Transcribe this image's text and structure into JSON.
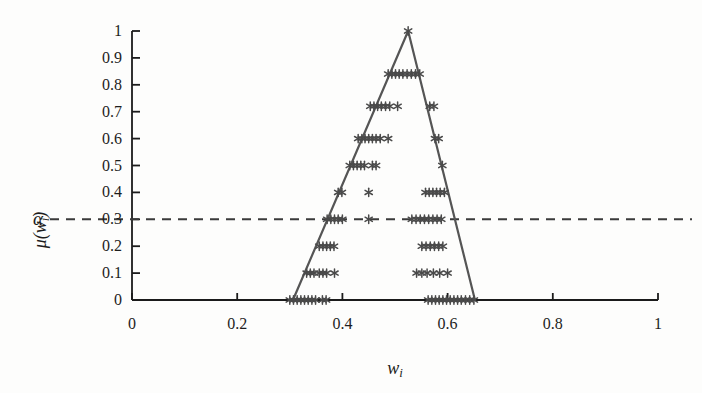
{
  "figure": {
    "background_color": "#fdfdfc",
    "axis_color": "#1b1b1b",
    "marker_color": "#4a4a4a",
    "triangle_color": "#555555",
    "dashed_color": "#3a3a3a"
  },
  "axes": {
    "x_label": "w",
    "x_label_sub": "i",
    "y_label": "μ(w",
    "y_label_sub": "i",
    "y_label_close": ")",
    "alpha_label": "α",
    "x_ticks": [
      "0",
      "0.2",
      "0.4",
      "0.6",
      "0.8",
      "1"
    ],
    "x_tick_values": [
      0,
      0.2,
      0.4,
      0.6,
      0.8,
      1
    ],
    "y_ticks": [
      "0",
      "0.1",
      "0.2",
      "0.3",
      "0.4",
      "0.5",
      "0.6",
      "0.7",
      "0.8",
      "0.9",
      "1"
    ],
    "y_tick_values": [
      0,
      0.1,
      0.2,
      0.3,
      0.4,
      0.5,
      0.6,
      0.7,
      0.8,
      0.9,
      1
    ]
  },
  "chart_data": {
    "type": "scatter",
    "title": "",
    "xlabel": "w_i",
    "ylabel": "μ(w_i)",
    "xlim": [
      0,
      1
    ],
    "ylim": [
      0,
      1
    ],
    "grid": false,
    "legend": null,
    "annotations": [
      {
        "name": "alpha-cut-line",
        "type": "horizontal-dashed-line",
        "y": 0.3,
        "label": "α"
      }
    ],
    "triangular_membership_function": {
      "name": "triangular-fuzzy-number",
      "left": 0.306,
      "peak": 0.525,
      "right": 0.652,
      "peak_value": 1
    },
    "points": [
      {
        "x": 0.525,
        "y": 1.0
      },
      {
        "x": 0.487,
        "y": 0.84
      },
      {
        "x": 0.494,
        "y": 0.84
      },
      {
        "x": 0.501,
        "y": 0.84
      },
      {
        "x": 0.508,
        "y": 0.84
      },
      {
        "x": 0.515,
        "y": 0.84
      },
      {
        "x": 0.523,
        "y": 0.84
      },
      {
        "x": 0.531,
        "y": 0.84
      },
      {
        "x": 0.539,
        "y": 0.84
      },
      {
        "x": 0.547,
        "y": 0.84
      },
      {
        "x": 0.453,
        "y": 0.72
      },
      {
        "x": 0.46,
        "y": 0.72
      },
      {
        "x": 0.467,
        "y": 0.72
      },
      {
        "x": 0.474,
        "y": 0.72
      },
      {
        "x": 0.482,
        "y": 0.72
      },
      {
        "x": 0.49,
        "y": 0.72
      },
      {
        "x": 0.505,
        "y": 0.72
      },
      {
        "x": 0.566,
        "y": 0.72
      },
      {
        "x": 0.574,
        "y": 0.72
      },
      {
        "x": 0.43,
        "y": 0.6
      },
      {
        "x": 0.437,
        "y": 0.6
      },
      {
        "x": 0.443,
        "y": 0.6
      },
      {
        "x": 0.45,
        "y": 0.6
      },
      {
        "x": 0.457,
        "y": 0.6
      },
      {
        "x": 0.464,
        "y": 0.6
      },
      {
        "x": 0.472,
        "y": 0.6
      },
      {
        "x": 0.487,
        "y": 0.6
      },
      {
        "x": 0.576,
        "y": 0.6
      },
      {
        "x": 0.583,
        "y": 0.6
      },
      {
        "x": 0.414,
        "y": 0.5
      },
      {
        "x": 0.421,
        "y": 0.5
      },
      {
        "x": 0.428,
        "y": 0.5
      },
      {
        "x": 0.435,
        "y": 0.5
      },
      {
        "x": 0.442,
        "y": 0.5
      },
      {
        "x": 0.457,
        "y": 0.5
      },
      {
        "x": 0.464,
        "y": 0.5
      },
      {
        "x": 0.59,
        "y": 0.5
      },
      {
        "x": 0.392,
        "y": 0.4
      },
      {
        "x": 0.399,
        "y": 0.4
      },
      {
        "x": 0.45,
        "y": 0.4
      },
      {
        "x": 0.558,
        "y": 0.4
      },
      {
        "x": 0.565,
        "y": 0.4
      },
      {
        "x": 0.572,
        "y": 0.4
      },
      {
        "x": 0.579,
        "y": 0.4
      },
      {
        "x": 0.586,
        "y": 0.4
      },
      {
        "x": 0.594,
        "y": 0.4
      },
      {
        "x": 0.371,
        "y": 0.3
      },
      {
        "x": 0.378,
        "y": 0.3
      },
      {
        "x": 0.385,
        "y": 0.3
      },
      {
        "x": 0.392,
        "y": 0.3
      },
      {
        "x": 0.4,
        "y": 0.3
      },
      {
        "x": 0.45,
        "y": 0.3
      },
      {
        "x": 0.532,
        "y": 0.3
      },
      {
        "x": 0.54,
        "y": 0.3
      },
      {
        "x": 0.548,
        "y": 0.3
      },
      {
        "x": 0.556,
        "y": 0.3
      },
      {
        "x": 0.564,
        "y": 0.3
      },
      {
        "x": 0.572,
        "y": 0.3
      },
      {
        "x": 0.58,
        "y": 0.3
      },
      {
        "x": 0.588,
        "y": 0.3
      },
      {
        "x": 0.356,
        "y": 0.2
      },
      {
        "x": 0.363,
        "y": 0.2
      },
      {
        "x": 0.37,
        "y": 0.2
      },
      {
        "x": 0.377,
        "y": 0.2
      },
      {
        "x": 0.384,
        "y": 0.2
      },
      {
        "x": 0.551,
        "y": 0.2
      },
      {
        "x": 0.559,
        "y": 0.2
      },
      {
        "x": 0.567,
        "y": 0.2
      },
      {
        "x": 0.575,
        "y": 0.2
      },
      {
        "x": 0.583,
        "y": 0.2
      },
      {
        "x": 0.591,
        "y": 0.2
      },
      {
        "x": 0.332,
        "y": 0.1
      },
      {
        "x": 0.339,
        "y": 0.1
      },
      {
        "x": 0.346,
        "y": 0.1
      },
      {
        "x": 0.356,
        "y": 0.1
      },
      {
        "x": 0.363,
        "y": 0.1
      },
      {
        "x": 0.37,
        "y": 0.1
      },
      {
        "x": 0.385,
        "y": 0.1
      },
      {
        "x": 0.541,
        "y": 0.1
      },
      {
        "x": 0.551,
        "y": 0.1
      },
      {
        "x": 0.561,
        "y": 0.1
      },
      {
        "x": 0.573,
        "y": 0.1
      },
      {
        "x": 0.585,
        "y": 0.1
      },
      {
        "x": 0.6,
        "y": 0.1
      },
      {
        "x": 0.3,
        "y": 0.0
      },
      {
        "x": 0.307,
        "y": 0.0
      },
      {
        "x": 0.314,
        "y": 0.0
      },
      {
        "x": 0.321,
        "y": 0.0
      },
      {
        "x": 0.328,
        "y": 0.0
      },
      {
        "x": 0.335,
        "y": 0.0
      },
      {
        "x": 0.342,
        "y": 0.0
      },
      {
        "x": 0.349,
        "y": 0.0
      },
      {
        "x": 0.362,
        "y": 0.0
      },
      {
        "x": 0.369,
        "y": 0.0
      },
      {
        "x": 0.563,
        "y": 0.0
      },
      {
        "x": 0.57,
        "y": 0.0
      },
      {
        "x": 0.577,
        "y": 0.0
      },
      {
        "x": 0.584,
        "y": 0.0
      },
      {
        "x": 0.591,
        "y": 0.0
      },
      {
        "x": 0.598,
        "y": 0.0
      },
      {
        "x": 0.605,
        "y": 0.0
      },
      {
        "x": 0.612,
        "y": 0.0
      },
      {
        "x": 0.619,
        "y": 0.0
      },
      {
        "x": 0.626,
        "y": 0.0
      },
      {
        "x": 0.634,
        "y": 0.0
      },
      {
        "x": 0.642,
        "y": 0.0
      },
      {
        "x": 0.65,
        "y": 0.0
      }
    ]
  }
}
